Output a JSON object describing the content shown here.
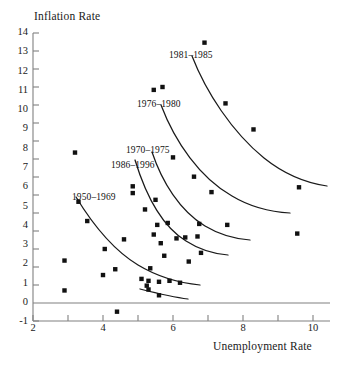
{
  "chart_data": {
    "type": "scatter",
    "title": "",
    "xlabel": "Unemployment Rate",
    "ylabel": "Inflation Rate",
    "xlim": [
      2,
      10
    ],
    "ylim": [
      -1,
      14
    ],
    "xticks": [
      2,
      4,
      6,
      8,
      10
    ],
    "xminorticks": [
      3,
      5,
      7,
      9
    ],
    "yticks": [
      -1,
      0,
      1,
      2,
      3,
      4,
      5,
      6,
      7,
      8,
      9,
      10,
      11,
      12,
      13,
      14
    ],
    "grid": false,
    "legend": "inline-annotations",
    "marker": "square",
    "marker_color": "#111111",
    "curve_color": "#1a1a1a",
    "axis_color": "#808080",
    "zero_line": 0,
    "points": [
      [
        2.9,
        2.2
      ],
      [
        2.9,
        0.65
      ],
      [
        3.3,
        5.25
      ],
      [
        3.2,
        7.8
      ],
      [
        3.55,
        4.25
      ],
      [
        4.0,
        1.45
      ],
      [
        4.05,
        2.8
      ],
      [
        4.35,
        1.75
      ],
      [
        4.4,
        -0.45
      ],
      [
        4.6,
        3.3
      ],
      [
        4.85,
        6.05
      ],
      [
        4.85,
        5.7
      ],
      [
        5.1,
        1.25
      ],
      [
        5.2,
        4.85
      ],
      [
        5.25,
        0.9
      ],
      [
        5.3,
        0.7
      ],
      [
        5.3,
        1.15
      ],
      [
        5.35,
        1.8
      ],
      [
        5.45,
        11.05
      ],
      [
        5.45,
        3.55
      ],
      [
        5.5,
        5.35
      ],
      [
        5.55,
        4.05
      ],
      [
        5.6,
        0.4
      ],
      [
        5.6,
        1.1
      ],
      [
        5.65,
        3.1
      ],
      [
        5.7,
        11.2
      ],
      [
        5.75,
        2.45
      ],
      [
        5.85,
        4.15
      ],
      [
        5.9,
        1.15
      ],
      [
        6.0,
        7.55
      ],
      [
        6.1,
        3.35
      ],
      [
        6.2,
        1.05
      ],
      [
        6.35,
        3.4
      ],
      [
        6.45,
        2.15
      ],
      [
        6.6,
        6.55
      ],
      [
        6.7,
        3.45
      ],
      [
        6.75,
        4.1
      ],
      [
        6.8,
        2.6
      ],
      [
        6.9,
        13.5
      ],
      [
        7.1,
        5.75
      ],
      [
        7.5,
        10.35
      ],
      [
        7.55,
        4.05
      ],
      [
        8.3,
        9.0
      ],
      [
        9.6,
        6.0
      ],
      [
        9.55,
        3.6
      ]
    ],
    "series_annotations": [
      {
        "label": "1981–1985",
        "x": 169,
        "y": 50
      },
      {
        "label": "1976–1980",
        "x": 137,
        "y": 99
      },
      {
        "label": "1970–1975",
        "x": 126,
        "y": 145
      },
      {
        "label": "1986–1996",
        "x": 111,
        "y": 160
      },
      {
        "label": "1950–1969",
        "x": 72,
        "y": 192
      }
    ],
    "fitted_curves": [
      {
        "name": "1981-1985",
        "path": "M 192 56 C 206 92, 232 132, 264 158 C 284 174, 306 183, 327 186"
      },
      {
        "name": "1976-1980",
        "path": "M 161 105 C 175 142, 200 178, 232 196 C 252 208, 272 212, 290 213"
      },
      {
        "name": "1970-1975",
        "path": "M 152 152 C 162 182, 180 211, 205 226 C 220 235, 236 239, 250 240"
      },
      {
        "name": "1986-1996",
        "path": "M 135 160 C 146 196, 163 227, 186 241 C 200 250, 215 254, 228 255"
      },
      {
        "name": "1950-1969",
        "path": "M 76 197 C 90 220, 110 248, 138 265 C 158 277, 180 283, 200 285"
      },
      {
        "name": "low-flat",
        "path": "M 140 289 C 156 293, 172 297, 188 299"
      }
    ]
  },
  "axis": {
    "y_title": "Inflation Rate",
    "x_title": "Unemployment Rate",
    "y_tick_labels": [
      "14",
      "13",
      "12",
      "11",
      "10",
      "9",
      "8",
      "7",
      "6",
      "5",
      "4",
      "3",
      "2",
      "1",
      "0",
      "-1"
    ],
    "x_tick_labels": [
      "2",
      "4",
      "6",
      "8",
      "10"
    ]
  }
}
